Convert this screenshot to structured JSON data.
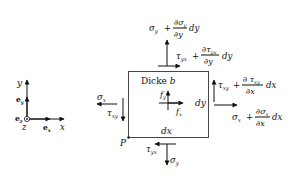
{
  "coordinate_system": {
    "y_axis_label": "y",
    "x_axis_label": "x",
    "z_axis_label": "z",
    "unit_vector_y": "e",
    "unit_vector_y_sub": "y",
    "unit_vector_x": "e",
    "unit_vector_x_sub": "x",
    "unit_vector_z": "e",
    "unit_vector_z_sub": "z"
  },
  "element": {
    "thickness_label": "Dicke",
    "thickness_symbol": "b",
    "width_label": "dx",
    "height_label": "dy",
    "corner_point": "P",
    "body_force_x": "f",
    "body_force_x_sub": "x",
    "body_force_y": "f",
    "body_force_y_sub": "y"
  },
  "stresses": {
    "left_normal": {
      "sym": "σ",
      "sub": "x"
    },
    "left_shear": {
      "sym": "τ",
      "sub": "xy"
    },
    "bottom_normal": {
      "sym": "σ",
      "sub": "y"
    },
    "bottom_shear": {
      "sym": "τ",
      "sub": "yx"
    },
    "top_normal": {
      "sym": "σ",
      "sub": "y",
      "plus": "+",
      "num": "∂σ",
      "num_sub": "y",
      "den": "∂y",
      "tail": "dy"
    },
    "top_shear": {
      "sym": "τ",
      "sub": "yx",
      "plus": "+",
      "num": "∂τ",
      "num_sub": "yx",
      "den": "∂y",
      "tail": "dy"
    },
    "right_shear": {
      "sym": "τ",
      "sub": "xy",
      "plus": "+",
      "num": "∂ τ",
      "num_sub": "xy",
      "den": "∂x",
      "tail": "dx"
    },
    "right_normal": {
      "sym": "σ",
      "sub": "x",
      "plus": "+",
      "num": "∂σ",
      "num_sub": "x",
      "den": "∂x",
      "tail": "dx"
    }
  }
}
